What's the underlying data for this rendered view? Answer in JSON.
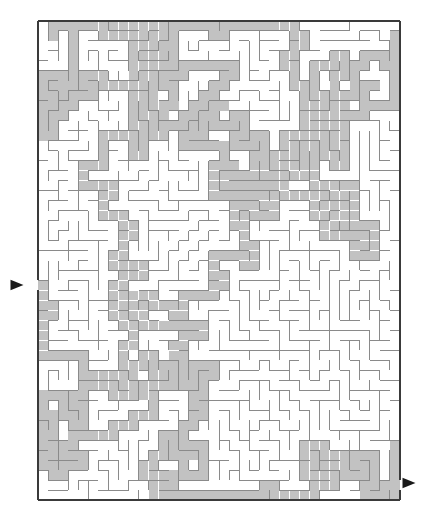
{
  "document": {
    "type": "maze-puzzle",
    "title": "Maze",
    "page_width": 434,
    "page_height": 529,
    "background_color": "#ffffff"
  },
  "maze": {
    "origin_x": 38,
    "origin_y": 21,
    "width": 362,
    "height": 479,
    "columns": 36,
    "rows": 48,
    "cell_size": 10.0556,
    "wall_color": "#8a8a8a",
    "wall_width": 1,
    "border_color": "#3a3a3a",
    "border_width": 2,
    "path_fill_color": "#c2c2c2",
    "path_edge_color": "#9a9a9a",
    "cell_background": "#ffffff",
    "seed": 20240517
  },
  "entrance": {
    "label": "entrance",
    "side": "left",
    "row": 26,
    "marker": "triangle-right",
    "marker_color": "#1a1a1a",
    "marker_x": 17,
    "marker_y": 285,
    "marker_size": 13
  },
  "exit": {
    "label": "exit",
    "side": "right",
    "row": 46,
    "marker": "triangle-right",
    "marker_color": "#1a1a1a",
    "marker_x": 409,
    "marker_y": 483,
    "marker_size": 13
  },
  "solution": {
    "label": "solution-path",
    "visible": true,
    "style": "shaded-corridor",
    "description": "Gray shaded corridor from left entrance through the maze to bottom-right exit"
  }
}
